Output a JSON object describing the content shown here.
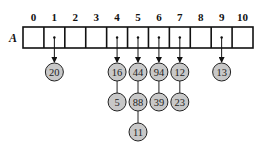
{
  "array": {
    "label": "A",
    "indices": [
      "0",
      "1",
      "2",
      "3",
      "4",
      "5",
      "6",
      "7",
      "8",
      "9",
      "10"
    ],
    "box": {
      "x": 23,
      "y": 27,
      "width": 230,
      "height": 21
    },
    "stroke": "#111111"
  },
  "node_style": {
    "fill": "#c8c8c8",
    "stroke": "#222222",
    "radius": 9
  },
  "chains": [
    {
      "index": 1,
      "nodes": [
        "20"
      ]
    },
    {
      "index": 4,
      "nodes": [
        "16",
        "5"
      ]
    },
    {
      "index": 5,
      "nodes": [
        "44",
        "88",
        "11"
      ]
    },
    {
      "index": 6,
      "nodes": [
        "94",
        "39"
      ]
    },
    {
      "index": 7,
      "nodes": [
        "12",
        "23"
      ]
    },
    {
      "index": 9,
      "nodes": [
        "13"
      ]
    }
  ],
  "levels_y": [
    72,
    102,
    132
  ]
}
